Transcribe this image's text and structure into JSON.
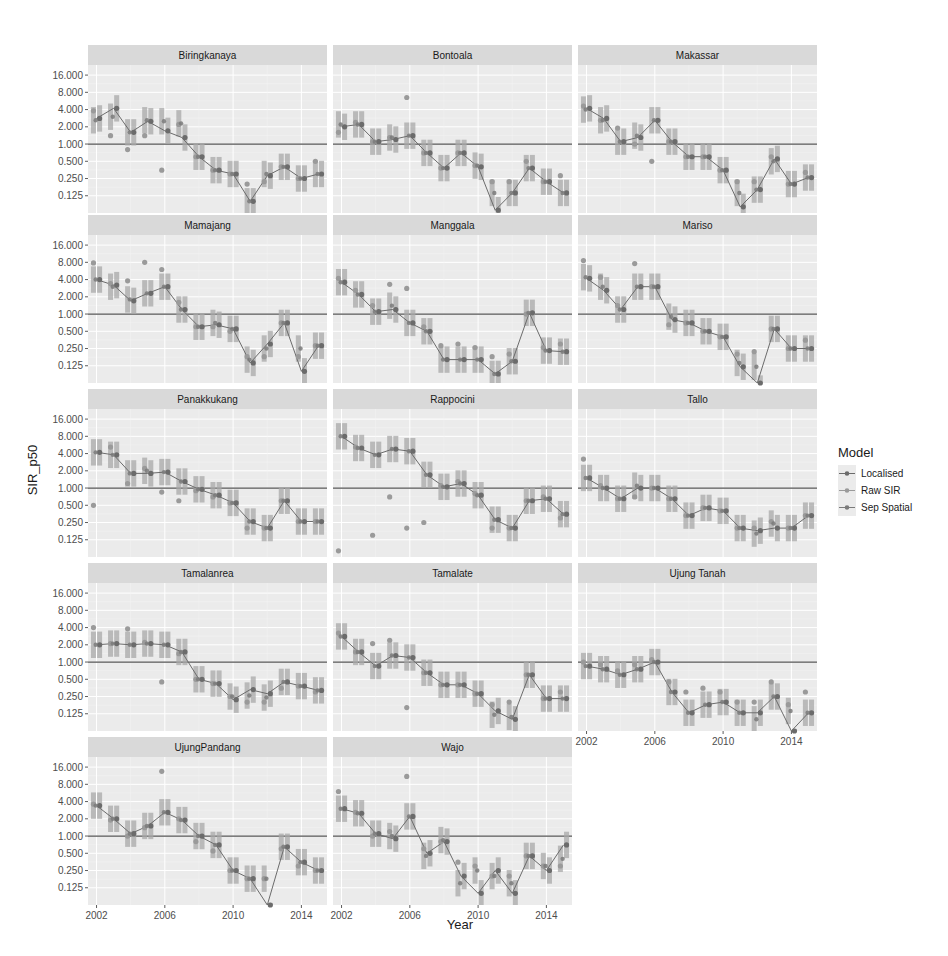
{
  "chart_data": {
    "type": "line",
    "title": "",
    "xlabel": "Year",
    "ylabel": "SIR_p50",
    "yscale": "log2",
    "ylim": [
      0.0625,
      24
    ],
    "xlim": [
      2001.5,
      2015.5
    ],
    "y_ticks": [
      16,
      8,
      4,
      2,
      1,
      0.5,
      0.25,
      0.125
    ],
    "y_tick_labels": [
      "16.000",
      "8.000",
      "4.000",
      "2.000",
      "1.000",
      "0.500",
      "0.250",
      "0.125"
    ],
    "x_ticks": [
      2002,
      2006,
      2010,
      2014
    ],
    "x_tick_labels": [
      "2002",
      "2006",
      "2010",
      "2014"
    ],
    "reference_line": 1.0,
    "grid": true,
    "legend": {
      "title": "Model",
      "placement": "right",
      "entries": [
        "Localised",
        "Raw SIR",
        "Sep Spatial"
      ]
    },
    "colors": {
      "panel_bg": "#ebebeb",
      "strip_bg": "#d9d9d9",
      "grid": "#ffffff",
      "reference_line": "#555555",
      "Localised": "#6b6b6b",
      "Raw SIR": "#9a9a9a",
      "Sep Spatial": "#7a7a7a",
      "interval": "#a8a8a8"
    },
    "years": [
      2002,
      2003,
      2004,
      2005,
      2006,
      2007,
      2008,
      2009,
      2010,
      2011,
      2012,
      2013,
      2014,
      2015
    ],
    "panels": [
      {
        "name": "Biringkanaya",
        "localised": [
          2.8,
          4.2,
          1.6,
          2.5,
          1.7,
          1.3,
          0.6,
          0.35,
          0.3,
          0.1,
          0.28,
          0.4,
          0.25,
          0.3
        ],
        "raw": [
          3.8,
          1.4,
          0.8,
          1.4,
          0.35,
          2.2,
          0.6,
          0.35,
          0.3,
          0.2,
          0.22,
          0.4,
          0.25,
          0.5
        ],
        "sep": [
          2.6,
          3.0,
          1.6,
          2.6,
          2.5,
          2.3,
          0.6,
          0.35,
          0.3,
          0.1,
          0.3,
          0.4,
          0.25,
          0.3
        ]
      },
      {
        "name": "Bontoala",
        "localised": [
          2.0,
          2.2,
          1.1,
          1.2,
          1.4,
          0.7,
          0.38,
          0.7,
          0.4,
          0.07,
          0.14,
          0.38,
          0.22,
          0.14
        ],
        "raw": [
          1.6,
          2.4,
          1.1,
          1.3,
          6.5,
          0.7,
          0.38,
          0.7,
          0.42,
          0.22,
          0.22,
          0.5,
          0.22,
          0.28
        ],
        "sep": [
          2.2,
          2.2,
          1.1,
          1.3,
          1.4,
          0.7,
          0.38,
          0.7,
          0.42,
          0.14,
          0.14,
          0.38,
          0.22,
          0.14
        ]
      },
      {
        "name": "Makassar",
        "localised": [
          4.2,
          2.8,
          1.1,
          1.3,
          2.6,
          1.1,
          0.6,
          0.6,
          0.35,
          0.08,
          0.16,
          0.55,
          0.2,
          0.26
        ],
        "raw": [
          4.6,
          2.6,
          1.9,
          1.0,
          0.5,
          1.1,
          0.6,
          0.6,
          0.35,
          0.22,
          0.22,
          0.6,
          0.2,
          0.32
        ],
        "sep": [
          4.0,
          2.6,
          1.1,
          1.4,
          2.6,
          1.1,
          0.6,
          0.6,
          0.35,
          0.14,
          0.16,
          0.5,
          0.2,
          0.26
        ]
      },
      {
        "name": "Mamajang",
        "localised": [
          4.0,
          3.2,
          1.7,
          2.3,
          3.0,
          1.2,
          0.6,
          0.65,
          0.55,
          0.14,
          0.3,
          0.7,
          0.1,
          0.28
        ],
        "raw": [
          7.8,
          3.4,
          3.8,
          8.0,
          6.0,
          1.6,
          0.6,
          0.6,
          0.5,
          0.18,
          0.18,
          0.7,
          0.18,
          0.28
        ],
        "sep": [
          4.0,
          3.0,
          1.8,
          2.3,
          3.0,
          1.2,
          0.6,
          0.7,
          0.55,
          0.16,
          0.25,
          0.7,
          0.25,
          0.28
        ]
      },
      {
        "name": "Manggala",
        "localised": [
          3.6,
          2.2,
          1.1,
          1.2,
          0.7,
          0.5,
          0.16,
          0.16,
          0.16,
          0.09,
          0.15,
          1.05,
          0.23,
          0.22
        ],
        "raw": [
          4.2,
          2.6,
          1.4,
          3.3,
          2.8,
          0.6,
          0.28,
          0.3,
          0.26,
          0.18,
          0.2,
          1.0,
          0.26,
          0.3
        ],
        "sep": [
          3.6,
          2.2,
          1.1,
          1.4,
          0.7,
          0.5,
          0.16,
          0.16,
          0.16,
          0.09,
          0.15,
          1.05,
          0.23,
          0.22
        ]
      },
      {
        "name": "Mariso",
        "localised": [
          4.2,
          2.6,
          1.2,
          3.0,
          3.0,
          0.8,
          0.7,
          0.5,
          0.4,
          0.12,
          0.05,
          0.55,
          0.25,
          0.25
        ],
        "raw": [
          8.6,
          4.4,
          1.4,
          7.6,
          3.0,
          0.65,
          0.7,
          0.5,
          0.4,
          0.2,
          0.22,
          0.55,
          0.25,
          0.35
        ],
        "sep": [
          4.4,
          3.0,
          1.2,
          3.0,
          3.0,
          0.9,
          0.7,
          0.5,
          0.4,
          0.14,
          0.12,
          0.55,
          0.25,
          0.25
        ]
      },
      {
        "name": "Panakkukang",
        "localised": [
          4.2,
          3.8,
          1.8,
          1.8,
          1.9,
          1.3,
          0.95,
          0.75,
          0.55,
          0.26,
          0.2,
          0.6,
          0.26,
          0.26
        ],
        "raw": [
          0.5,
          5.2,
          1.2,
          2.2,
          0.85,
          0.6,
          0.9,
          0.7,
          0.55,
          0.2,
          0.2,
          0.6,
          0.26,
          0.26
        ],
        "sep": [
          4.2,
          3.8,
          1.8,
          2.0,
          1.9,
          1.3,
          0.95,
          0.75,
          0.55,
          0.26,
          0.2,
          0.6,
          0.26,
          0.26
        ]
      },
      {
        "name": "Rappocini",
        "localised": [
          8.0,
          5.0,
          3.8,
          4.8,
          4.4,
          1.7,
          1.05,
          1.2,
          0.75,
          0.28,
          0.2,
          0.6,
          0.65,
          0.35
        ],
        "raw": [
          0.08,
          5.2,
          0.15,
          0.7,
          0.2,
          0.25,
          1.1,
          1.3,
          0.8,
          0.2,
          0.2,
          0.6,
          0.7,
          0.3
        ],
        "sep": [
          8.0,
          5.0,
          3.8,
          4.8,
          4.4,
          1.7,
          1.05,
          1.2,
          0.75,
          0.28,
          0.2,
          0.6,
          0.65,
          0.35
        ]
      },
      {
        "name": "Tallo",
        "localised": [
          1.5,
          1.0,
          0.65,
          1.0,
          1.0,
          0.65,
          0.33,
          0.45,
          0.4,
          0.2,
          0.18,
          0.2,
          0.2,
          0.33
        ],
        "raw": [
          3.2,
          1.1,
          0.65,
          0.7,
          1.0,
          0.65,
          0.33,
          0.45,
          0.4,
          0.2,
          0.2,
          0.26,
          0.2,
          0.33
        ],
        "sep": [
          1.5,
          1.0,
          0.65,
          1.1,
          1.0,
          0.65,
          0.33,
          0.45,
          0.4,
          0.2,
          0.16,
          0.24,
          0.2,
          0.33
        ]
      },
      {
        "name": "Tamalanrea",
        "localised": [
          2.0,
          2.1,
          2.0,
          2.1,
          2.0,
          1.5,
          0.5,
          0.42,
          0.22,
          0.33,
          0.28,
          0.45,
          0.38,
          0.32
        ],
        "raw": [
          4.0,
          2.1,
          3.8,
          2.2,
          0.45,
          1.4,
          0.5,
          0.42,
          0.25,
          0.2,
          0.2,
          0.35,
          0.38,
          0.3
        ],
        "sep": [
          2.0,
          2.1,
          2.0,
          2.1,
          2.0,
          1.5,
          0.5,
          0.42,
          0.25,
          0.26,
          0.24,
          0.45,
          0.38,
          0.32
        ]
      },
      {
        "name": "Tamalate",
        "localised": [
          2.8,
          1.5,
          0.85,
          1.3,
          1.2,
          0.65,
          0.4,
          0.4,
          0.28,
          0.14,
          0.1,
          0.6,
          0.23,
          0.23
        ],
        "raw": [
          3.2,
          1.5,
          2.1,
          2.4,
          0.16,
          0.65,
          0.4,
          0.4,
          0.28,
          0.18,
          0.2,
          0.6,
          0.23,
          0.3
        ],
        "sep": [
          2.8,
          1.5,
          0.85,
          1.3,
          1.2,
          0.65,
          0.4,
          0.4,
          0.28,
          0.12,
          0.11,
          0.6,
          0.23,
          0.23
        ]
      },
      {
        "name": "Ujung Tanah",
        "localised": [
          0.85,
          0.75,
          0.6,
          0.75,
          1.0,
          0.3,
          0.13,
          0.18,
          0.2,
          0.13,
          0.13,
          0.25,
          0.04,
          0.13
        ],
        "raw": [
          1.0,
          0.9,
          0.7,
          0.9,
          1.1,
          0.45,
          0.3,
          0.35,
          0.3,
          0.2,
          0.2,
          0.45,
          0.18,
          0.3
        ],
        "sep": [
          0.85,
          0.75,
          0.6,
          0.75,
          1.0,
          0.3,
          0.13,
          0.18,
          0.2,
          0.13,
          0.1,
          0.25,
          0.14,
          0.13
        ]
      },
      {
        "name": "UjungPandang",
        "localised": [
          3.4,
          2.0,
          1.1,
          1.5,
          2.6,
          1.9,
          1.0,
          0.7,
          0.25,
          0.18,
          0.04,
          0.65,
          0.35,
          0.25
        ],
        "raw": [
          3.6,
          1.9,
          1.0,
          1.4,
          13.5,
          2.0,
          0.8,
          0.55,
          0.25,
          0.18,
          0.18,
          0.6,
          0.3,
          0.25
        ],
        "sep": [
          3.4,
          2.0,
          1.1,
          1.5,
          2.6,
          1.9,
          1.0,
          0.7,
          0.25,
          0.18,
          0.18,
          0.65,
          0.35,
          0.25
        ]
      },
      {
        "name": "Wajo",
        "localised": [
          3.0,
          2.5,
          1.1,
          0.9,
          2.2,
          0.5,
          0.8,
          0.2,
          0.1,
          0.25,
          0.1,
          0.45,
          0.25,
          0.7
        ],
        "raw": [
          6.0,
          2.6,
          1.0,
          1.2,
          11.0,
          0.6,
          0.8,
          0.35,
          0.3,
          0.2,
          0.2,
          0.45,
          0.3,
          0.3
        ],
        "sep": [
          3.0,
          2.5,
          1.1,
          1.0,
          2.2,
          0.45,
          0.85,
          0.15,
          0.25,
          0.2,
          0.15,
          0.45,
          0.3,
          0.4
        ]
      }
    ]
  }
}
